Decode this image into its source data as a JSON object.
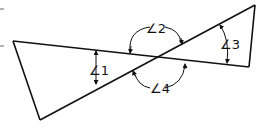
{
  "diagram": {
    "stroke_color": "#111111",
    "background": "#ffffff",
    "labels": {
      "angle1": "∠1",
      "angle2": "∠2",
      "angle3": "∠3",
      "angle4": "∠4"
    },
    "figure": {
      "left_triangle_vertices": [
        [
          13,
          41
        ],
        [
          40,
          120
        ],
        [
          157,
          57
        ]
      ],
      "right_triangle_vertices": [
        [
          255,
          5
        ],
        [
          249,
          67
        ],
        [
          157,
          57
        ]
      ],
      "intersection_point": [
        157,
        57
      ]
    }
  }
}
